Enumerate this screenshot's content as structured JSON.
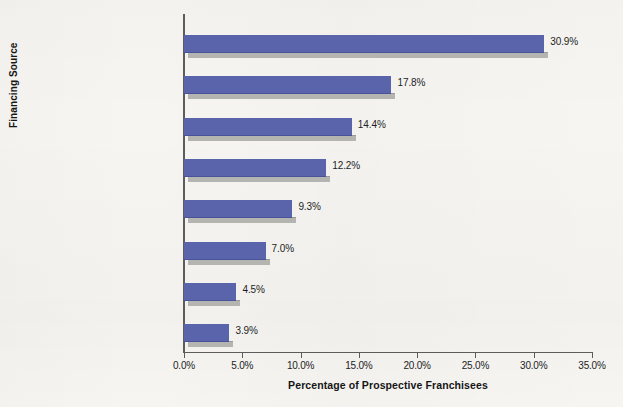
{
  "chart_data": {
    "type": "bar",
    "orientation": "horizontal",
    "title": "",
    "xlabel": "Percentage of Prospective Franchisees",
    "ylabel": "Financing Source",
    "xlim": [
      0,
      35
    ],
    "xtick_values": [
      0,
      5,
      10,
      15,
      20,
      25,
      30,
      35
    ],
    "xtick_labels": [
      "0.0%",
      "5.0%",
      "10.0%",
      "15.0%",
      "20.0%",
      "25.0%",
      "30.0%",
      "35.0%"
    ],
    "grid": false,
    "legend": null,
    "bar_color": "#5a64ab",
    "shadow_color": "#b4b4b0",
    "categories": [
      "Personal savings/retirement account",
      "Commercial bank loan",
      "SBA loan",
      "Family and friends",
      "Grants",
      "Credit union loan",
      "Angel investor",
      "Credit cards"
    ],
    "values": [
      30.9,
      17.8,
      14.4,
      12.2,
      9.3,
      7.0,
      4.5,
      3.9
    ],
    "value_labels": [
      "30.9%",
      "17.8%",
      "14.4%",
      "12.2%",
      "9.3%",
      "7.0%",
      "4.5%",
      "3.9%"
    ]
  }
}
